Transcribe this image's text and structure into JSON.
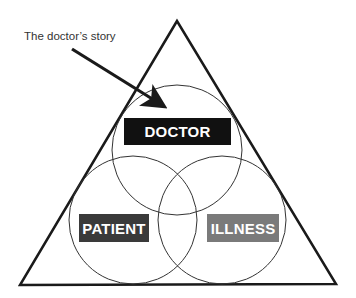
{
  "diagram": {
    "annotation": "The doctor’s story",
    "labels": {
      "doctor": "DOCTOR",
      "patient": "PATIENT",
      "illness": "ILLNESS"
    },
    "colors": {
      "doctor_box": "#111111",
      "patient_box": "#3a3a3a",
      "illness_box": "#7a7a7a",
      "lines": "#1a1a1a",
      "text": "#333333"
    },
    "shapes": {
      "triangle": "outer triangle enclosing three overlapping circles",
      "circles": [
        "doctor",
        "patient",
        "illness"
      ],
      "arrow": "points from annotation to doctor circle"
    }
  }
}
